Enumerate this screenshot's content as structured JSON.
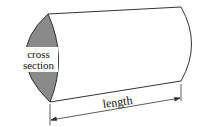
{
  "diagram": {
    "type": "3d-prism-with-cross-section",
    "labels": {
      "cross_section_line1": "cross",
      "cross_section_line2": "section",
      "length": "length"
    },
    "colors": {
      "cross_section_fill": "#8a8a8a",
      "outline": "#333333",
      "label_background": "#ffffff",
      "text": "#111111"
    }
  }
}
